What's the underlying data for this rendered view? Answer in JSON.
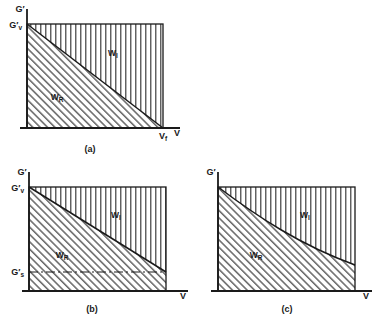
{
  "figure": {
    "panels": [
      {
        "id": "a",
        "caption": "(a)",
        "y_axis_label": "G'",
        "x_axis_label": "V",
        "y_tick_labels": [
          "G'v"
        ],
        "x_tick_labels": [
          "Vf"
        ],
        "regions": [
          {
            "name": "W_I",
            "label": "W",
            "sub": "I",
            "hatch": "vertical"
          },
          {
            "name": "W_R",
            "label": "W",
            "sub": "R",
            "hatch": "diagonal"
          }
        ],
        "boundary_type": "straight",
        "boundary_note": "straight line from G'v at left to Vf on the x-axis"
      },
      {
        "id": "b",
        "caption": "(b)",
        "y_axis_label": "G'",
        "x_axis_label": "V",
        "y_tick_labels": [
          "G'v",
          "G's"
        ],
        "x_tick_labels": [],
        "regions": [
          {
            "name": "W_I",
            "label": "W",
            "sub": "I",
            "hatch": "vertical"
          },
          {
            "name": "W_R",
            "label": "W",
            "sub": "R",
            "hatch": "diagonal"
          }
        ],
        "boundary_type": "straight",
        "boundary_note": "straight line from G'v at left to G's level at right edge",
        "dashed_line": "G's horizontal dash-dot reference line"
      },
      {
        "id": "c",
        "caption": "(c)",
        "y_axis_label": "G'",
        "x_axis_label": "V",
        "y_tick_labels": [],
        "x_tick_labels": [],
        "regions": [
          {
            "name": "W_I",
            "label": "W",
            "sub": "I",
            "hatch": "vertical"
          },
          {
            "name": "W_R",
            "label": "W",
            "sub": "R",
            "hatch": "diagonal"
          }
        ],
        "boundary_type": "curve",
        "boundary_note": "concave decreasing curve from top-left to lower right edge"
      }
    ],
    "colors": {
      "ink": "#1a1a1a",
      "background": "#ffffff",
      "hatch": "#2b2b2b"
    }
  }
}
